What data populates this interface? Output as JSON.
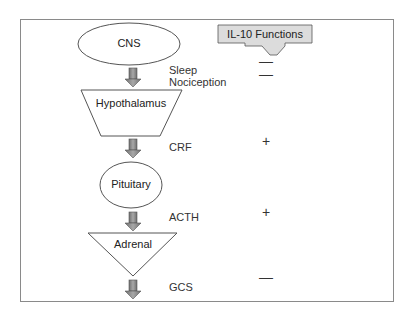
{
  "nodes": {
    "cns": "CNS",
    "hypothalamus": "Hypothalamus",
    "pituitary": "Pituitary",
    "adrenal": "Adrenal"
  },
  "effects": {
    "sleep": "Sleep",
    "nociception": "Nociception",
    "crf": "CRF",
    "acth": "ACTH",
    "gcs": "GCS"
  },
  "il10": {
    "title": "IL-10 Functions",
    "signs": {
      "sleep": "—",
      "nociception": "—",
      "crf": "+",
      "acth": "+",
      "gcs": "—"
    }
  },
  "colors": {
    "arrow_fill": "#8c8c8c",
    "box_fill": "#d9d9d9",
    "stroke": "#555555",
    "frame": "#8a8a8a"
  }
}
